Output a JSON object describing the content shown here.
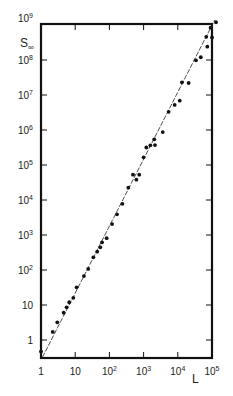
{
  "chart_data": {
    "type": "scatter",
    "title": "",
    "xlabel": "L",
    "ylabel": "S∞",
    "xscale": "log",
    "yscale": "log",
    "xlim": [
      1,
      100000
    ],
    "ylim": [
      0.3,
      1000000000
    ],
    "grid": false,
    "legend": null,
    "x_ticks": [
      {
        "value": 1,
        "label": "1"
      },
      {
        "value": 10,
        "label": "10"
      },
      {
        "value": 100,
        "label": "10",
        "sup": "2"
      },
      {
        "value": 1000,
        "label": "10",
        "sup": "3"
      },
      {
        "value": 10000,
        "label": "10",
        "sup": "4"
      },
      {
        "value": 100000,
        "label": "10",
        "sup": "5"
      }
    ],
    "y_ticks": [
      {
        "value": 1,
        "label": "1"
      },
      {
        "value": 10,
        "label": "10"
      },
      {
        "value": 100,
        "label": "10",
        "sup": "2"
      },
      {
        "value": 1000,
        "label": "10",
        "sup": "3"
      },
      {
        "value": 10000,
        "label": "10",
        "sup": "4"
      },
      {
        "value": 100000,
        "label": "10",
        "sup": "5"
      },
      {
        "value": 1000000,
        "label": "10",
        "sup": "6"
      },
      {
        "value": 10000000,
        "label": "10",
        "sup": "7"
      },
      {
        "value": 100000000,
        "label": "10",
        "sup": "8"
      },
      {
        "value": 1000000000,
        "label": "10",
        "sup": "9"
      }
    ],
    "series": [
      {
        "name": "data",
        "marker": "filled-circle",
        "points": [
          [
            1.0,
            0.47
          ],
          [
            2.2,
            1.7
          ],
          [
            3.0,
            3.2
          ],
          [
            4.6,
            6.0
          ],
          [
            5.6,
            8.6
          ],
          [
            6.7,
            12
          ],
          [
            8.8,
            16
          ],
          [
            11,
            32
          ],
          [
            18,
            67
          ],
          [
            24,
            107
          ],
          [
            34,
            230
          ],
          [
            44,
            333
          ],
          [
            54,
            445
          ],
          [
            61,
            617
          ],
          [
            83,
            810
          ],
          [
            120,
            2050
          ],
          [
            167,
            3900
          ],
          [
            240,
            7800
          ],
          [
            357,
            22500
          ],
          [
            490,
            53000
          ],
          [
            615,
            38000
          ],
          [
            745,
            53000
          ],
          [
            1000,
            166000
          ],
          [
            1200,
            316000
          ],
          [
            1580,
            364000
          ],
          [
            2150,
            372000
          ],
          [
            2050,
            540000
          ],
          [
            3630,
            870000
          ],
          [
            5400,
            3300000
          ],
          [
            8100,
            5200000
          ],
          [
            11400,
            6900000
          ],
          [
            13200,
            23000000
          ],
          [
            20800,
            22000000
          ],
          [
            34000,
            98000000
          ],
          [
            47000,
            120000000
          ],
          [
            73000,
            240000000
          ],
          [
            68000,
            460000000
          ],
          [
            100000,
            440000000
          ],
          [
            91000,
            840000000
          ],
          [
            131000,
            1200000000
          ]
        ]
      },
      {
        "name": "fit",
        "style": "thin-line",
        "points": [
          [
            1.1,
            0.32
          ],
          [
            120000,
            1400000000
          ]
        ]
      }
    ]
  }
}
